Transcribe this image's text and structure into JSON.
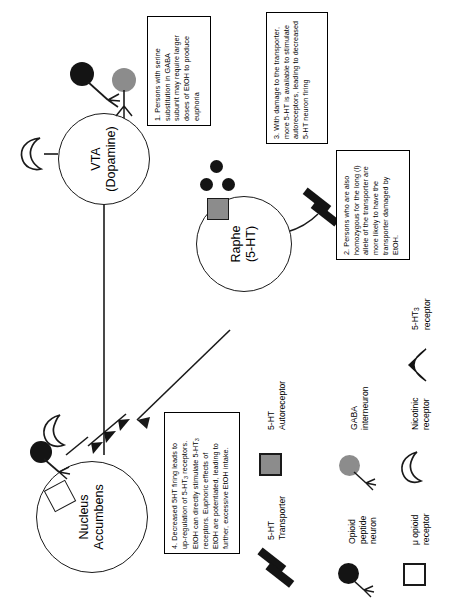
{
  "diagram": {
    "background": "#ffffff",
    "ink": "#1a1a1a",
    "gray": "#8c8c8c"
  },
  "nodes": [
    {
      "id": "vta",
      "label": "VTA\n(Dopamine)"
    },
    {
      "id": "raphe",
      "label": "Raphe\n(5-HT)"
    },
    {
      "id": "nacc",
      "label": "Nucleus\nAccumbens"
    }
  ],
  "callouts": [
    {
      "id": "note-1",
      "text": "1. Persons with serine\nsubstitution in GABA\nsubunit may require larger\ndoses of EtOH to produce\neuphoria"
    },
    {
      "id": "note-2",
      "text": "2. Persons who are also\nhomozygous for the long (l)\nallele of the transporter are\nmore likely to have the\ntransporter damaged by\nEtOH."
    },
    {
      "id": "note-3",
      "text": "3. With damage to the transporter,\nmore 5-HT is available to stimulate\nautoreceptors, leading to decreased\n5-HT neuron firing"
    },
    {
      "id": "note-4",
      "text": "4.  Decreased 5HT firing leads  to\nup-regulation of  5-HT3 receptors.\nEtOH can directly stimulate 5-HT3\nreceptors.   Euphoric effects of\nEtOH are potentiated, leading to\nfurther, excessive EtOH intake."
    }
  ],
  "legend": [
    {
      "id": "legend-5ht-autoreceptor",
      "label": "5-HT\nAutoreceptor",
      "glyph": "gray-square",
      "color": "#8c8c8c"
    },
    {
      "id": "legend-5ht-transporter",
      "label": "5-HT\nTransporter",
      "glyph": "black-bars",
      "color": "#141414"
    },
    {
      "id": "legend-gaba-interneuron",
      "label": "GABA\ninterneuron",
      "glyph": "gray-neuron",
      "color": "#8c8c8c"
    },
    {
      "id": "legend-opioid-peptide-neuron",
      "label": "Opioid\npeptide\nneuron",
      "glyph": "black-neuron",
      "color": "#141414"
    },
    {
      "id": "legend-nicotinic-receptor",
      "label": "Nicotinic\nreceptor",
      "glyph": "crescent",
      "color": "#1a1a1a"
    },
    {
      "id": "legend-mu-opioid-receptor",
      "label": "μ opioid\nreceptor",
      "glyph": "white-square",
      "color": "#1a1a1a"
    },
    {
      "id": "legend-5ht3-receptor",
      "label": "5-HT3\nreceptor",
      "glyph": "wedge",
      "color": "#141414"
    }
  ]
}
